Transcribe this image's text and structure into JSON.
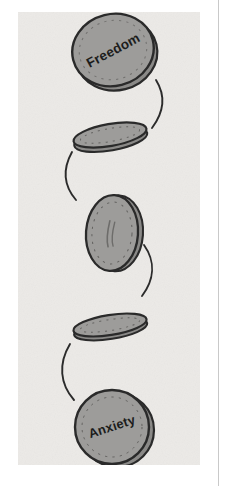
{
  "figure": {
    "panel": {
      "background_color": "#eceae7",
      "x": 18,
      "y": 12,
      "width": 182,
      "height": 453
    },
    "page_background_color": "#ffffff",
    "divider": {
      "name": "right-column-rule",
      "color": "#c9c9c9",
      "x": 218,
      "y": 0,
      "height": 486
    },
    "coin_colors": {
      "face": "#9d9c9a",
      "face_shadow": "#8a8987",
      "outline": "#2a2a2a",
      "rim": "#b4b3b0",
      "tick": "#2f2f2f",
      "arc": "#2b2b2b"
    },
    "stages": [
      {
        "id": "coin-freedom",
        "label": "Freedom",
        "orientation": "face-up-tilted",
        "label_rotation_deg": -14,
        "cx": 113,
        "cy": 50,
        "rx": 41,
        "ry": 36,
        "rotation_deg": -14
      },
      {
        "id": "coin-edge-upper",
        "label": "",
        "orientation": "edge-on-tilted",
        "cx": 110,
        "cy": 135,
        "rx": 37,
        "ry": 11,
        "rotation_deg": -10
      },
      {
        "id": "coin-mid",
        "label": "",
        "orientation": "edge-rotating-vertical",
        "cx": 112,
        "cy": 233,
        "rx": 26,
        "ry": 38,
        "rotation_deg": 4
      },
      {
        "id": "coin-edge-lower",
        "label": "",
        "orientation": "edge-on-tilted",
        "cx": 110,
        "cy": 325,
        "rx": 37,
        "ry": 10,
        "rotation_deg": -9
      },
      {
        "id": "coin-anxiety",
        "label": "Anxiety",
        "orientation": "face-up",
        "label_rotation_deg": -18,
        "cx": 112,
        "cy": 427,
        "rx": 37,
        "ry": 37,
        "rotation_deg": 0
      }
    ],
    "arcs": [
      {
        "id": "arc-1",
        "side": "right",
        "from_stage": "coin-freedom",
        "to_stage": "coin-edge-upper"
      },
      {
        "id": "arc-2",
        "side": "left",
        "from_stage": "coin-edge-upper",
        "to_stage": "coin-mid"
      },
      {
        "id": "arc-3",
        "side": "right",
        "from_stage": "coin-mid",
        "to_stage": "coin-edge-lower"
      },
      {
        "id": "arc-4",
        "side": "left",
        "from_stage": "coin-edge-lower",
        "to_stage": "coin-anxiety"
      }
    ]
  }
}
